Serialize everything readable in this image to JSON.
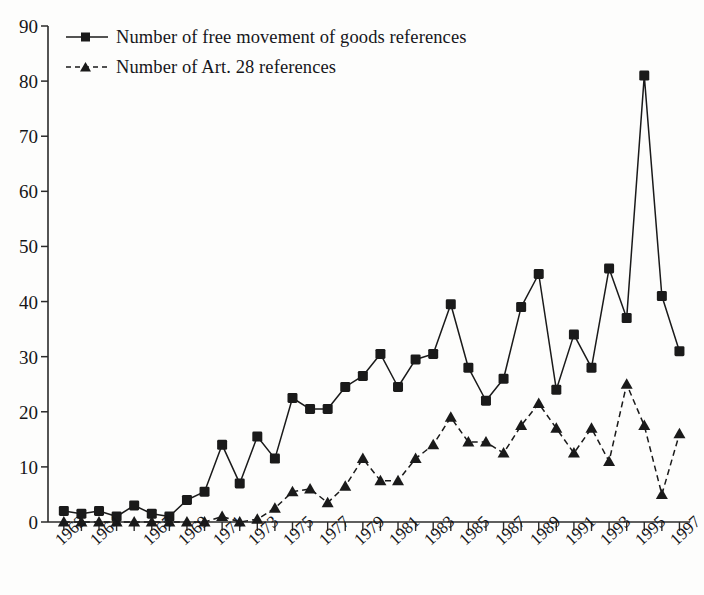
{
  "chart_data": {
    "type": "line",
    "title": "",
    "subtitle": "",
    "xlabel": "",
    "ylabel": "",
    "ylim": [
      0,
      90
    ],
    "ytick_step": 10,
    "yticks": [
      "0",
      "10",
      "20",
      "30",
      "40",
      "50",
      "60",
      "70",
      "80",
      "90"
    ],
    "grid": false,
    "legend_position": "top-left",
    "x": [
      1962,
      1963,
      1964,
      1965,
      1966,
      1967,
      1968,
      1969,
      1970,
      1971,
      1972,
      1973,
      1974,
      1975,
      1976,
      1977,
      1978,
      1979,
      1980,
      1981,
      1982,
      1983,
      1984,
      1985,
      1986,
      1987,
      1988,
      1989,
      1990,
      1991,
      1992,
      1993,
      1994,
      1995,
      1996,
      1997
    ],
    "xtick_labels": [
      "1962",
      "1964",
      "1967",
      "1969",
      "1971",
      "1973",
      "1975",
      "1977",
      "1979",
      "1981",
      "1983",
      "1985",
      "1987",
      "1989",
      "1991",
      "1993",
      "1995",
      "1997"
    ],
    "xtick_label_years": [
      1962,
      1964,
      1967,
      1969,
      1971,
      1973,
      1975,
      1977,
      1979,
      1981,
      1983,
      1985,
      1987,
      1989,
      1991,
      1993,
      1995,
      1997
    ],
    "series": [
      {
        "name": "Number of free movement of goods references",
        "marker": "square",
        "line_style": "solid",
        "color": "#1a1a1a",
        "values": [
          2,
          1.5,
          2,
          1,
          3,
          1.5,
          1,
          4,
          5.5,
          14,
          7,
          15.5,
          11.5,
          22.5,
          20.5,
          20.5,
          24.5,
          26.5,
          30.5,
          24.5,
          29.5,
          30.5,
          39.5,
          28,
          22,
          26,
          39,
          45,
          24,
          34,
          28,
          46,
          37,
          81,
          41,
          31
        ]
      },
      {
        "name": "Number of Art. 28 references",
        "marker": "triangle",
        "line_style": "dashed",
        "color": "#1a1a1a",
        "values": [
          0,
          0,
          0,
          0,
          0,
          0,
          0,
          0,
          0,
          1,
          0,
          0.5,
          2.5,
          5.5,
          6,
          3.5,
          6.5,
          11.5,
          7.5,
          7.5,
          11.5,
          14,
          19,
          14.5,
          14.5,
          12.5,
          17.5,
          21.5,
          17,
          12.5,
          17,
          11,
          25,
          17.5,
          5,
          16
        ]
      }
    ]
  },
  "axes": {
    "left_px": 48,
    "right_px": 690,
    "top_px": 26,
    "bottom_px": 522
  },
  "legend": {
    "items": [
      {
        "label": "Number of free movement of goods references",
        "marker": "square",
        "line_style": "solid"
      },
      {
        "label": "Number of Art. 28 references",
        "marker": "triangle",
        "line_style": "dashed"
      }
    ]
  }
}
